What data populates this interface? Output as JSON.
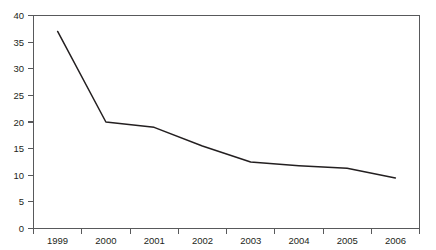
{
  "chart_data": {
    "type": "line",
    "title": "",
    "subtitle": "",
    "xlabel": "",
    "ylabel": "",
    "categories": [
      "1999",
      "2000",
      "2001",
      "2002",
      "2003",
      "2004",
      "2005",
      "2006"
    ],
    "series": [
      {
        "name": "",
        "values": [
          37,
          20,
          19,
          15.5,
          12.5,
          11.8,
          11.3,
          9.5
        ]
      }
    ],
    "x_tick_labels": [
      "1999",
      "2000",
      "2001",
      "2002",
      "2003",
      "2004",
      "2005",
      "2006"
    ],
    "y_tick_labels": [
      "0",
      "5",
      "10",
      "15",
      "20",
      "25",
      "30",
      "35",
      "40"
    ],
    "y_tick_values": [
      0,
      5,
      10,
      15,
      20,
      25,
      30,
      35,
      40
    ],
    "ylim": [
      0,
      40
    ],
    "grid": false,
    "legend": false,
    "legend_position": "none",
    "line_color": "#231f20",
    "axis_color": "#58595b",
    "background_color": "#ffffff"
  }
}
